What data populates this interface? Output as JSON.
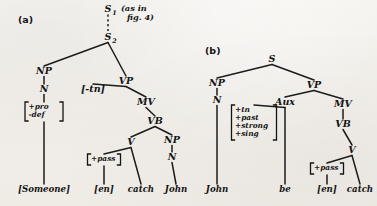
{
  "figure": {
    "background_color": "#f2efea",
    "ink_color": "#141414",
    "panels": [
      {
        "id": "a",
        "label": "(a)",
        "x": 18,
        "y": 23
      },
      {
        "id": "b",
        "label": "(b)",
        "x": 205,
        "y": 54
      }
    ],
    "annotations": [
      {
        "name": "fig-reference-note",
        "lines": [
          "(as in",
          "fig. 4)"
        ],
        "x": 121,
        "y": 11,
        "line_height": 9
      }
    ]
  },
  "tree_a": {
    "nodes": [
      {
        "id": "a_S1",
        "label": "S",
        "sub": "1",
        "x": 108,
        "y": 12
      },
      {
        "id": "a_S2",
        "label": "S",
        "sub": "2",
        "x": 108,
        "y": 40
      },
      {
        "id": "a_NP1",
        "label": "NP",
        "sub": "",
        "x": 44,
        "y": 74
      },
      {
        "id": "a_N1",
        "label": "N",
        "sub": "",
        "x": 44,
        "y": 92
      },
      {
        "id": "a_VP",
        "label": "VP",
        "sub": "",
        "x": 126,
        "y": 84
      },
      {
        "id": "a_tn",
        "label": "[-tn]",
        "sub": "",
        "x": 93,
        "y": 92
      },
      {
        "id": "a_MV",
        "label": "MV",
        "sub": "",
        "x": 146,
        "y": 105
      },
      {
        "id": "a_VB",
        "label": "VB",
        "sub": "",
        "x": 155,
        "y": 124
      },
      {
        "id": "a_V",
        "label": "V",
        "sub": "",
        "x": 131,
        "y": 145
      },
      {
        "id": "a_NP2",
        "label": "NP",
        "sub": "",
        "x": 172,
        "y": 143
      },
      {
        "id": "a_N2",
        "label": "N",
        "sub": "",
        "x": 172,
        "y": 160
      }
    ],
    "feature_matrices": [
      {
        "id": "a_feat_N1",
        "name": "feature-matrix-pro-def",
        "features": [
          "+pro",
          "-def"
        ],
        "x": 44,
        "y": 107,
        "width": 38,
        "line_height": 8
      },
      {
        "id": "a_feat_V",
        "name": "feature-matrix-pass",
        "features": [
          "+pass"
        ],
        "x": 104,
        "y": 159,
        "width": 33,
        "line_height": 8
      }
    ],
    "terminals": [
      {
        "id": "a_t_someone",
        "label": "[Someone]",
        "x": 44,
        "y": 192
      },
      {
        "id": "a_t_en",
        "label": "[en]",
        "x": 104,
        "y": 192
      },
      {
        "id": "a_t_catch",
        "label": "catch",
        "x": 141,
        "y": 192
      },
      {
        "id": "a_t_john",
        "label": "John",
        "x": 176,
        "y": 192
      }
    ],
    "edges": [
      {
        "from": "a_S1",
        "to": "a_S2",
        "style": "dashed"
      },
      {
        "from": "a_S2",
        "to": "a_NP1",
        "style": "solid"
      },
      {
        "from": "a_S2",
        "to": "a_VP",
        "style": "solid"
      },
      {
        "from": "a_NP1",
        "to": "a_N1",
        "style": "solid"
      },
      {
        "from": "a_N1",
        "to": "a_feat_N1",
        "style": "solid"
      },
      {
        "from": "a_feat_N1",
        "to": "a_t_someone",
        "style": "solid"
      },
      {
        "from": "a_VP",
        "to": "a_tn",
        "style": "solid"
      },
      {
        "from": "a_VP",
        "to": "a_MV",
        "style": "solid"
      },
      {
        "from": "a_MV",
        "to": "a_VB",
        "style": "solid"
      },
      {
        "from": "a_VB",
        "to": "a_V",
        "style": "solid"
      },
      {
        "from": "a_VB",
        "to": "a_NP2",
        "style": "solid"
      },
      {
        "from": "a_V",
        "to": "a_feat_V",
        "style": "solid"
      },
      {
        "from": "a_V",
        "to": "a_t_catch",
        "style": "solid"
      },
      {
        "from": "a_feat_V",
        "to": "a_t_en",
        "style": "solid"
      },
      {
        "from": "a_NP2",
        "to": "a_N2",
        "style": "solid"
      },
      {
        "from": "a_N2",
        "to": "a_t_john",
        "style": "solid"
      }
    ]
  },
  "tree_b": {
    "nodes": [
      {
        "id": "b_S",
        "label": "S",
        "sub": "",
        "x": 272,
        "y": 62
      },
      {
        "id": "b_NP",
        "label": "NP",
        "sub": "",
        "x": 217,
        "y": 86
      },
      {
        "id": "b_N",
        "label": "N",
        "sub": "",
        "x": 217,
        "y": 103
      },
      {
        "id": "b_VP",
        "label": "VP",
        "sub": "",
        "x": 314,
        "y": 88
      },
      {
        "id": "b_Aux",
        "label": "Aux",
        "sub": "",
        "x": 285,
        "y": 105
      },
      {
        "id": "b_MV",
        "label": "MV",
        "sub": "",
        "x": 343,
        "y": 107
      },
      {
        "id": "b_VB",
        "label": "VB",
        "sub": "",
        "x": 343,
        "y": 127
      },
      {
        "id": "b_V",
        "label": "V",
        "sub": "",
        "x": 352,
        "y": 153
      }
    ],
    "feature_matrices": [
      {
        "id": "b_feat_Aux",
        "name": "feature-matrix-aux",
        "features": [
          "+tn",
          "+past",
          "+strong",
          "+sing"
        ],
        "x": 254,
        "y": 110,
        "width": 45,
        "line_height": 8
      },
      {
        "id": "b_feat_V",
        "name": "feature-matrix-pass-b",
        "features": [
          "+pass"
        ],
        "x": 327,
        "y": 168,
        "width": 33,
        "line_height": 8
      }
    ],
    "terminals": [
      {
        "id": "b_t_john",
        "label": "John",
        "x": 217,
        "y": 192
      },
      {
        "id": "b_t_be",
        "label": "be",
        "x": 285,
        "y": 192
      },
      {
        "id": "b_t_en",
        "label": "[en]",
        "x": 327,
        "y": 192
      },
      {
        "id": "b_t_catch",
        "label": "catch",
        "x": 360,
        "y": 192
      }
    ],
    "edges": [
      {
        "from": "b_S",
        "to": "b_NP",
        "style": "solid"
      },
      {
        "from": "b_S",
        "to": "b_VP",
        "style": "solid"
      },
      {
        "from": "b_NP",
        "to": "b_N",
        "style": "solid"
      },
      {
        "from": "b_N",
        "to": "b_t_john",
        "style": "solid"
      },
      {
        "from": "b_VP",
        "to": "b_Aux",
        "style": "solid"
      },
      {
        "from": "b_VP",
        "to": "b_MV",
        "style": "solid"
      },
      {
        "from": "b_Aux",
        "to": "b_feat_Aux",
        "style": "solid"
      },
      {
        "from": "b_Aux",
        "to": "b_t_be",
        "style": "solid"
      },
      {
        "from": "b_MV",
        "to": "b_VB",
        "style": "solid"
      },
      {
        "from": "b_VB",
        "to": "b_V",
        "style": "solid"
      },
      {
        "from": "b_V",
        "to": "b_feat_V",
        "style": "solid"
      },
      {
        "from": "b_V",
        "to": "b_t_catch",
        "style": "solid"
      },
      {
        "from": "b_feat_V",
        "to": "b_t_en",
        "style": "solid"
      }
    ]
  }
}
